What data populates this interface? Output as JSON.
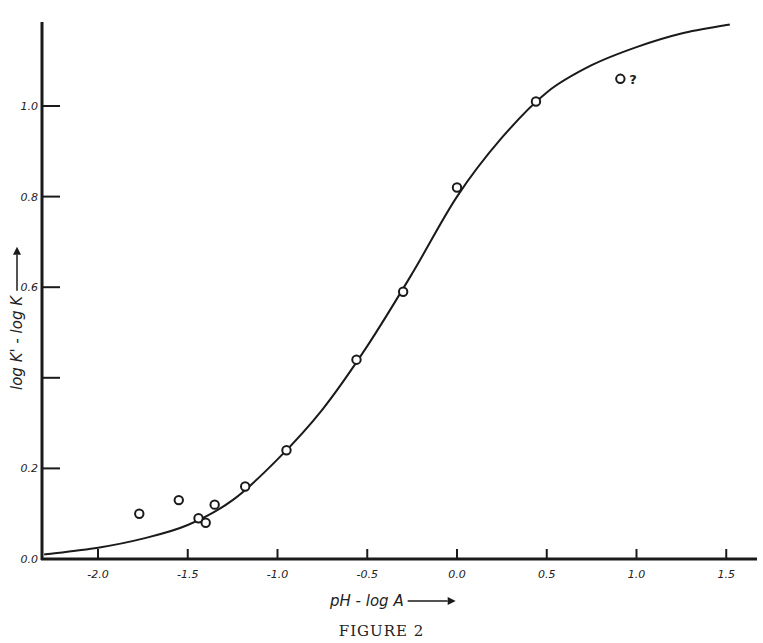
{
  "caption": "FIGURE 2",
  "chart_data": {
    "type": "scatter",
    "title": "",
    "xlabel": "pH - log A",
    "ylabel": "log K' - log K",
    "xlim": [
      -2.3,
      1.7
    ],
    "ylim": [
      0.0,
      1.2
    ],
    "x_ticks": [
      {
        "value": -2.0,
        "label": "-2.0"
      },
      {
        "value": -1.5,
        "label": "-1.5"
      },
      {
        "value": -1.0,
        "label": "-1.0"
      },
      {
        "value": -0.5,
        "label": "-0.5"
      },
      {
        "value": 0.0,
        "label": "0.0"
      },
      {
        "value": 0.5,
        "label": "0.5"
      },
      {
        "value": 1.0,
        "label": "1.0"
      },
      {
        "value": 1.5,
        "label": "1.5"
      }
    ],
    "y_ticks": [
      {
        "value": 0.0,
        "label": "0.0"
      },
      {
        "value": 0.2,
        "label": "0.2"
      },
      {
        "value": 0.4,
        "label": ""
      },
      {
        "value": 0.6,
        "label": "0.6"
      },
      {
        "value": 0.8,
        "label": "0.8"
      },
      {
        "value": 1.0,
        "label": "1.0"
      }
    ],
    "grid": false,
    "series": [
      {
        "name": "observed",
        "marker": "open-circle",
        "points": [
          {
            "x": -1.77,
            "y": 0.1
          },
          {
            "x": -1.55,
            "y": 0.13
          },
          {
            "x": -1.44,
            "y": 0.09
          },
          {
            "x": -1.4,
            "y": 0.08
          },
          {
            "x": -1.35,
            "y": 0.12
          },
          {
            "x": -1.18,
            "y": 0.16
          },
          {
            "x": -0.95,
            "y": 0.24
          },
          {
            "x": -0.56,
            "y": 0.44
          },
          {
            "x": -0.3,
            "y": 0.59
          },
          {
            "x": 0.0,
            "y": 0.82
          },
          {
            "x": 0.44,
            "y": 1.01
          },
          {
            "x": 0.91,
            "y": 1.06,
            "annotation": "?"
          }
        ]
      },
      {
        "name": "theoretical curve",
        "style": "line",
        "points": [
          {
            "x": -2.3,
            "y": 0.01
          },
          {
            "x": -2.0,
            "y": 0.025
          },
          {
            "x": -1.75,
            "y": 0.045
          },
          {
            "x": -1.5,
            "y": 0.075
          },
          {
            "x": -1.25,
            "y": 0.13
          },
          {
            "x": -1.0,
            "y": 0.22
          },
          {
            "x": -0.75,
            "y": 0.33
          },
          {
            "x": -0.5,
            "y": 0.47
          },
          {
            "x": -0.25,
            "y": 0.63
          },
          {
            "x": 0.0,
            "y": 0.8
          },
          {
            "x": 0.25,
            "y": 0.93
          },
          {
            "x": 0.5,
            "y": 1.03
          },
          {
            "x": 0.75,
            "y": 1.09
          },
          {
            "x": 1.0,
            "y": 1.13
          },
          {
            "x": 1.25,
            "y": 1.16
          },
          {
            "x": 1.52,
            "y": 1.18
          }
        ]
      }
    ],
    "annotations": [
      {
        "text": "?",
        "x": 0.91,
        "y": 1.06
      }
    ]
  }
}
